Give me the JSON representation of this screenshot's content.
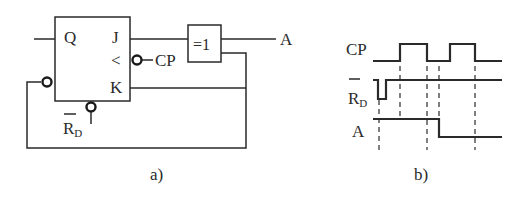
{
  "figure": {
    "part_a": {
      "caption": "a)",
      "flip_flop": {
        "type": "JK flip-flop",
        "pins": {
          "q": "Q",
          "j": "J",
          "clock": "<",
          "k": "K"
        },
        "clock_input_label": "CP",
        "reset_label_main": "R",
        "reset_label_sub": "D",
        "reset_overbar": true
      },
      "xor_gate": {
        "label": "=1"
      },
      "output_label": "A"
    },
    "part_b": {
      "caption": "b)",
      "signals": [
        {
          "name": "CP",
          "overbar": false
        },
        {
          "name": "R",
          "sub": "D",
          "overbar": true
        },
        {
          "name": "A",
          "overbar": false
        }
      ]
    }
  }
}
